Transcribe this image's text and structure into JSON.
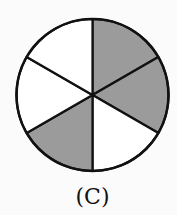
{
  "diagram": {
    "type": "fraction-circle",
    "sectors_total": 6,
    "shaded_sectors": [
      0,
      1,
      3
    ],
    "shaded_fraction": "3/6",
    "colors": {
      "shaded": "#9b9b9b",
      "unshaded": "#ffffff",
      "stroke": "#111111"
    },
    "sectors": [
      {
        "index": 0,
        "position": "top-right",
        "shaded": true
      },
      {
        "index": 1,
        "position": "right",
        "shaded": true
      },
      {
        "index": 2,
        "position": "bottom-right",
        "shaded": false
      },
      {
        "index": 3,
        "position": "bottom-left",
        "shaded": true
      },
      {
        "index": 4,
        "position": "left",
        "shaded": false
      },
      {
        "index": 5,
        "position": "top-left",
        "shaded": false
      }
    ]
  },
  "caption": "(C)"
}
